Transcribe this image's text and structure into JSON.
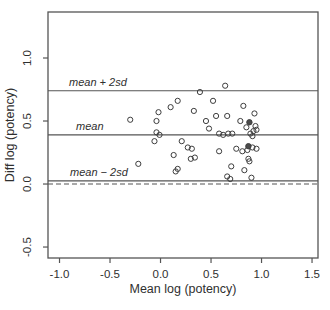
{
  "figure": {
    "background": "#ffffff",
    "ink_color": "#3d3d3d",
    "line_color": "#555555",
    "marker_color": "#3d3d3d",
    "dark_marker_fill": "#4a4a4a"
  },
  "chart_data": {
    "type": "scatter",
    "title": "",
    "xlabel": "Mean log (potency)",
    "ylabel": "Diff log (potency)",
    "xlim": [
      -1.114,
      1.559
    ],
    "ylim": [
      -0.587,
      1.365
    ],
    "grid": false,
    "legend": null,
    "x_ticks": [
      -1.0,
      -0.5,
      0.0,
      0.5,
      1.0,
      1.5
    ],
    "x_tick_labels": [
      "-1.0",
      "-0.5",
      "0.0",
      "0.5",
      "1.0",
      "1.5"
    ],
    "y_ticks": [
      -0.5,
      0.0,
      0.5,
      1.0
    ],
    "y_tick_labels": [
      "-0.5",
      "0.0",
      "0.5",
      "1.0"
    ],
    "reference_lines": [
      {
        "label": "mean + 2sd",
        "value": 0.74,
        "style": "solid",
        "label_x": -0.62
      },
      {
        "label": "mean",
        "value": 0.39,
        "style": "solid",
        "label_x": -0.7
      },
      {
        "label": "mean − 2sd",
        "value": 0.025,
        "style": "solid",
        "label_x": -0.61
      },
      {
        "label": "",
        "value": 0.0,
        "style": "dashed",
        "label_x": null
      }
    ],
    "marker": "open-circle",
    "points": [
      [
        -0.3,
        0.51
      ],
      [
        -0.04,
        0.5
      ],
      [
        -0.02,
        0.57
      ],
      [
        0.1,
        0.61
      ],
      [
        0.17,
        0.66
      ],
      [
        0.33,
        0.58
      ],
      [
        0.39,
        0.73
      ],
      [
        0.64,
        0.78
      ],
      [
        -0.04,
        0.41
      ],
      [
        -0.01,
        0.39
      ],
      [
        -0.06,
        0.34
      ],
      [
        0.21,
        0.34
      ],
      [
        0.27,
        0.29
      ],
      [
        0.45,
        0.5
      ],
      [
        0.52,
        0.66
      ],
      [
        0.82,
        0.62
      ],
      [
        0.93,
        0.56
      ],
      [
        0.55,
        0.54
      ],
      [
        0.66,
        0.54
      ],
      [
        0.48,
        0.44
      ],
      [
        0.79,
        0.5
      ],
      [
        0.85,
        0.45
      ],
      [
        0.94,
        0.46
      ],
      [
        0.92,
        0.42
      ],
      [
        0.95,
        0.43
      ],
      [
        0.58,
        0.4
      ],
      [
        0.62,
        0.39
      ],
      [
        0.67,
        0.4
      ],
      [
        0.71,
        0.4
      ],
      [
        0.89,
        0.4
      ],
      [
        0.91,
        0.38
      ],
      [
        0.31,
        0.28
      ],
      [
        0.13,
        0.23
      ],
      [
        0.3,
        0.2
      ],
      [
        0.34,
        0.21
      ],
      [
        -0.22,
        0.16
      ],
      [
        0.15,
        0.1
      ],
      [
        0.17,
        0.12
      ],
      [
        0.58,
        0.26
      ],
      [
        0.75,
        0.28
      ],
      [
        0.81,
        0.26
      ],
      [
        0.86,
        0.27
      ],
      [
        0.95,
        0.28
      ],
      [
        0.91,
        0.29
      ],
      [
        0.87,
        0.2
      ],
      [
        0.88,
        0.18
      ],
      [
        0.7,
        0.14
      ],
      [
        0.83,
        0.11
      ],
      [
        0.66,
        0.06
      ],
      [
        0.69,
        0.04
      ],
      [
        0.9,
        0.05
      ]
    ],
    "dark_points": [
      [
        0.88,
        0.49
      ],
      [
        0.87,
        0.3
      ]
    ]
  }
}
